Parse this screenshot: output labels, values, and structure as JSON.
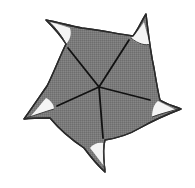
{
  "figure": {
    "type": "illustration",
    "colors": {
      "background": "#ffffff",
      "body_fill": "#7a7a7a",
      "outline": "#2a2a2a",
      "tip_fill": "#f4f4f4",
      "spoke": "#111111"
    },
    "center": [
      99,
      87
    ],
    "points": 5,
    "spokes": [
      {
        "from": [
          99,
          87
        ],
        "to": [
          68,
          48
        ]
      },
      {
        "from": [
          99,
          87
        ],
        "to": [
          129,
          40
        ]
      },
      {
        "from": [
          99,
          87
        ],
        "to": [
          150,
          100
        ]
      },
      {
        "from": [
          99,
          87
        ],
        "to": [
          103,
          138
        ]
      },
      {
        "from": [
          99,
          87
        ],
        "to": [
          57,
          106
        ]
      }
    ]
  }
}
